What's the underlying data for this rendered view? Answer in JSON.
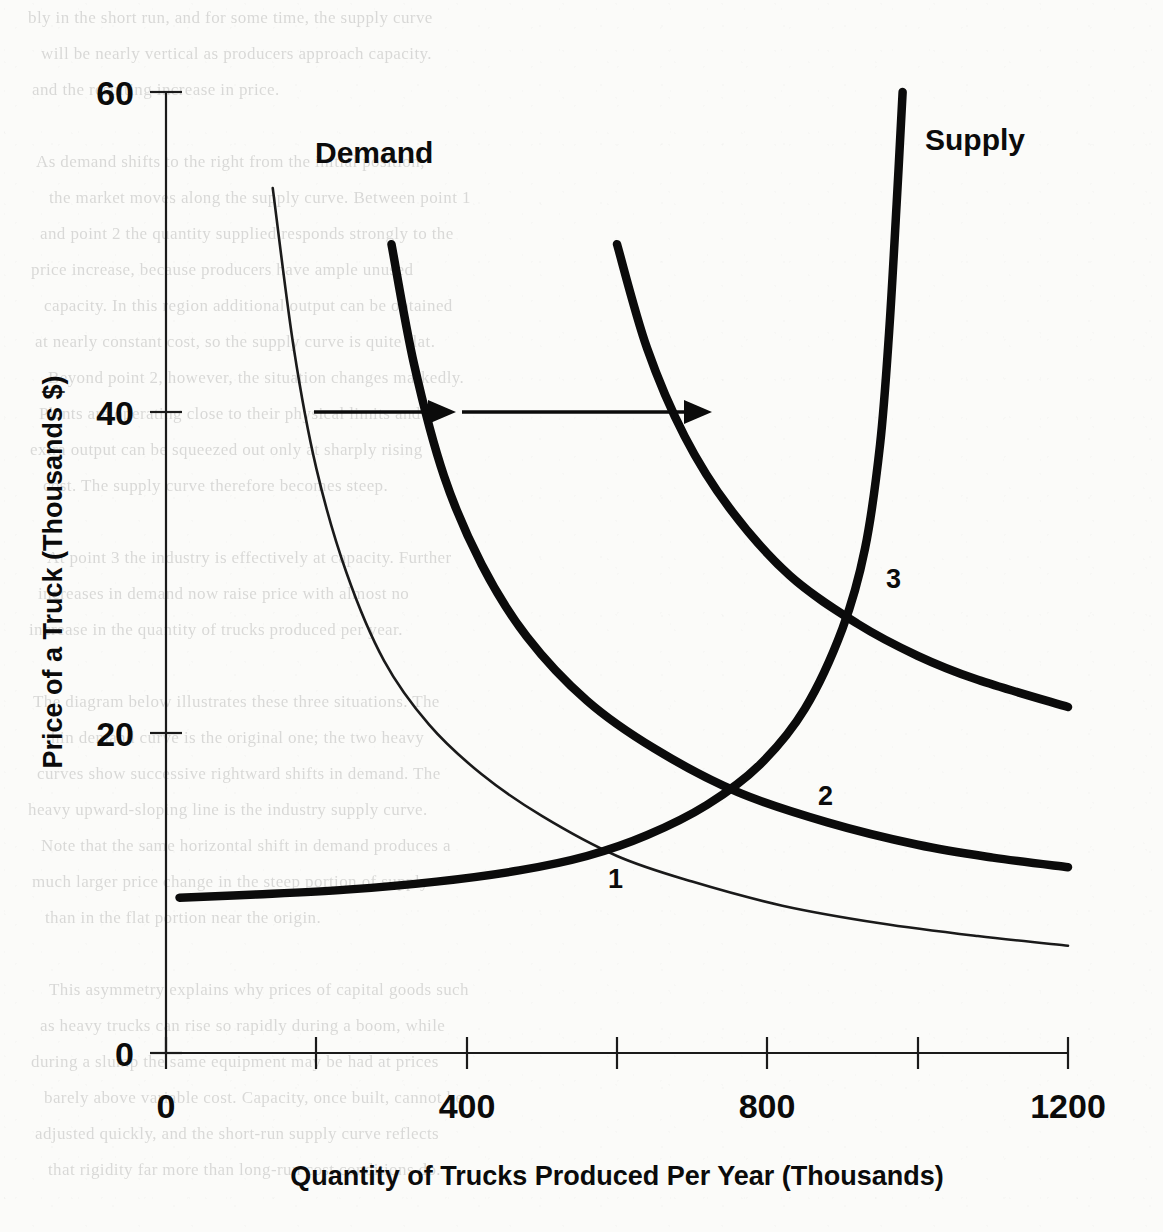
{
  "chart_data": {
    "type": "line",
    "title": "",
    "xlabel": "Quantity of Trucks Produced Per Year (Thousands)",
    "ylabel": "Price of a Truck (Thousands $)",
    "xlim": [
      0,
      1200
    ],
    "ylim": [
      0,
      60
    ],
    "grid": false,
    "legend_position": "inline-labels",
    "x_ticks": [
      {
        "value": 0,
        "label": "0",
        "major": true
      },
      {
        "value": 200,
        "label": "",
        "major": false
      },
      {
        "value": 400,
        "label": "400",
        "major": true
      },
      {
        "value": 600,
        "label": "",
        "major": false
      },
      {
        "value": 800,
        "label": "800",
        "major": true
      },
      {
        "value": 1000,
        "label": "",
        "major": false
      },
      {
        "value": 1200,
        "label": "1200",
        "major": true
      }
    ],
    "y_ticks": [
      {
        "value": 0,
        "label": "0"
      },
      {
        "value": 20,
        "label": "20"
      },
      {
        "value": 40,
        "label": "40"
      },
      {
        "value": 60,
        "label": "60"
      }
    ],
    "series": [
      {
        "name": "Demand 1",
        "style": "thin",
        "label": "Demand",
        "points": [
          [
            142,
            54.0
          ],
          [
            170,
            44.0
          ],
          [
            200,
            36.5
          ],
          [
            240,
            30.0
          ],
          [
            290,
            24.5
          ],
          [
            350,
            20.5
          ],
          [
            420,
            17.4
          ],
          [
            500,
            14.8
          ],
          [
            600,
            12.3
          ],
          [
            700,
            10.7
          ],
          [
            820,
            9.2
          ],
          [
            950,
            8.1
          ],
          [
            1080,
            7.3
          ],
          [
            1200,
            6.7
          ]
        ]
      },
      {
        "name": "Demand 2",
        "style": "thick",
        "points": [
          [
            300,
            50.5
          ],
          [
            330,
            43.0
          ],
          [
            370,
            36.0
          ],
          [
            420,
            30.5
          ],
          [
            480,
            26.0
          ],
          [
            560,
            22.0
          ],
          [
            650,
            19.0
          ],
          [
            760,
            16.3
          ],
          [
            880,
            14.4
          ],
          [
            1000,
            13.0
          ],
          [
            1100,
            12.2
          ],
          [
            1200,
            11.6
          ]
        ]
      },
      {
        "name": "Demand 3",
        "style": "thick",
        "points": [
          [
            600,
            50.5
          ],
          [
            640,
            44.0
          ],
          [
            690,
            38.5
          ],
          [
            750,
            34.0
          ],
          [
            830,
            29.8
          ],
          [
            920,
            26.8
          ],
          [
            1000,
            24.8
          ],
          [
            1080,
            23.3
          ],
          [
            1200,
            21.6
          ]
        ]
      },
      {
        "name": "Supply",
        "style": "thick",
        "label": "Supply",
        "points": [
          [
            18,
            9.7
          ],
          [
            120,
            9.9
          ],
          [
            240,
            10.2
          ],
          [
            360,
            10.7
          ],
          [
            470,
            11.4
          ],
          [
            560,
            12.3
          ],
          [
            640,
            13.6
          ],
          [
            720,
            15.5
          ],
          [
            790,
            18.0
          ],
          [
            850,
            21.5
          ],
          [
            900,
            26.5
          ],
          [
            930,
            31.5
          ],
          [
            950,
            38.0
          ],
          [
            962,
            45.0
          ],
          [
            972,
            53.0
          ],
          [
            980,
            60.0
          ]
        ]
      }
    ],
    "equilibrium_points": [
      {
        "label": "1",
        "x": 600,
        "y": 12.6
      },
      {
        "label": "2",
        "x": 865,
        "y": 17.5
      },
      {
        "label": "3",
        "x": 955,
        "y": 32.0
      }
    ],
    "annotations": [
      {
        "type": "arrow",
        "label": "demand-shift-arrow-1",
        "from": [
          197,
          40
        ],
        "to": [
          368,
          40
        ],
        "direction": "right"
      },
      {
        "type": "arrow",
        "label": "demand-shift-arrow-2",
        "from": [
          394,
          40
        ],
        "to": [
          725,
          40
        ],
        "direction": "right"
      },
      {
        "type": "text",
        "label": "Demand",
        "x": 315,
        "y": 152
      },
      {
        "type": "text",
        "label": "Supply",
        "x": 925,
        "y": 137
      }
    ]
  },
  "labels": {
    "demand": "Demand",
    "supply": "Supply",
    "x_title": "Quantity of Trucks Produced Per Year (Thousands)",
    "y_title": "Price of a Truck (Thousands $)",
    "y_60": "60",
    "y_40": "40",
    "y_20": "20",
    "y_0": "0",
    "x_0": "0",
    "x_400": "400",
    "x_800": "800",
    "x_1200": "1200",
    "point_1": "1",
    "point_2": "2",
    "point_3": "3"
  },
  "background_text": {
    "lines": [
      "bly in the short run, and for some time, the supply curve",
      "will be nearly vertical as producers approach capacity.",
      "and the resulting increase in price.",
      "",
      "As demand shifts to the right from the initial position,",
      "the market moves along the supply curve. Between point 1",
      "and point 2 the quantity supplied responds strongly to the",
      "price increase, because producers have ample unused",
      "capacity. In this region additional output can be obtained",
      "at nearly constant cost, so the supply curve is quite flat.",
      "Beyond point 2, however, the situation changes markedly.",
      "Plants are operating close to their physical limits and",
      "extra output can be squeezed out only at sharply rising",
      "cost. The supply curve therefore becomes steep.",
      "",
      "At point 3 the industry is effectively at capacity. Further",
      "increases in demand now raise price with almost no",
      "increase in the quantity of trucks produced per year.",
      "",
      "The diagram below illustrates these three situations. The",
      "thin demand curve is the original one; the two heavy",
      "curves show successive rightward shifts in demand. The",
      "heavy upward-sloping line is the industry supply curve.",
      "Note that the same horizontal shift in demand produces a",
      "much larger price change in the steep portion of supply",
      "than in the flat portion near the origin.",
      "",
      "This asymmetry explains why prices of capital goods such",
      "as heavy trucks can rise so rapidly during a boom, while",
      "during a slump the same equipment may be had at prices",
      "barely above variable cost. Capacity, once built, cannot be",
      "adjusted quickly, and the short-run supply curve reflects",
      "that rigidity far more than long-run cost conditions do."
    ]
  },
  "colors": {
    "ink": "#0b0b0b",
    "paper": "#fbfbf9",
    "bleed": "rgba(40,40,40,0.16)"
  }
}
